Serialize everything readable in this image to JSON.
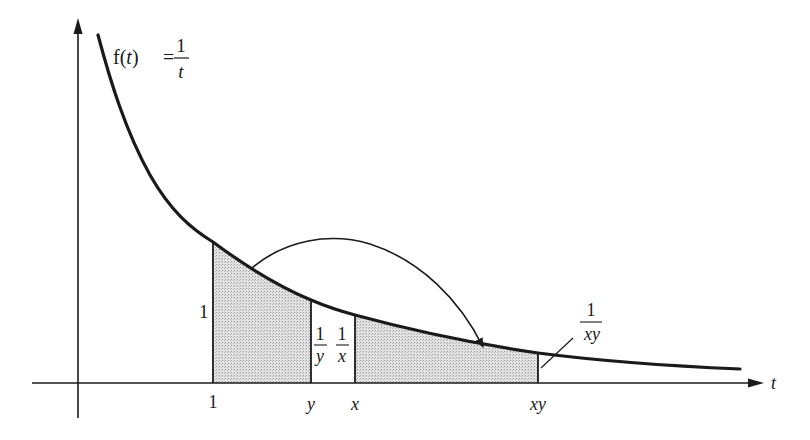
{
  "diagram": {
    "function_label": {
      "lhs": "f(",
      "var": "t",
      "rhs": ")",
      "eq": "=",
      "num": "1",
      "den": "t"
    },
    "axis": {
      "x_label": "t"
    },
    "ticks": [
      {
        "id": "one",
        "label": "1",
        "italic": false
      },
      {
        "id": "y",
        "label": "y",
        "italic": true
      },
      {
        "id": "x",
        "label": "x",
        "italic": true
      },
      {
        "id": "xy",
        "label": "xy",
        "italic": true
      }
    ],
    "heights": {
      "at_one": "1",
      "at_y": {
        "num": "1",
        "den": "y"
      },
      "at_x": {
        "num": "1",
        "den": "x"
      },
      "at_xy": {
        "num": "1",
        "den": "xy"
      }
    },
    "shaded_regions": [
      "from 1 to y",
      "from x to xy"
    ],
    "arrow": "area from 1 to y maps onto area from x to xy",
    "colors": {
      "ink": "#1a1a1a",
      "shade": "#d9d9d9"
    }
  }
}
